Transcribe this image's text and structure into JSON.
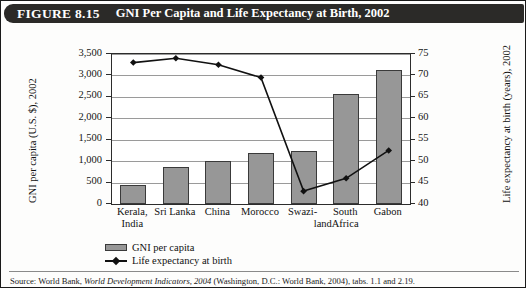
{
  "figure": {
    "label": "FIGURE 8.15",
    "title": "GNI Per Capita and Life Expectancy at Birth, 2002"
  },
  "source": {
    "prefix": "Source: World Bank,",
    "italic": "World Development Indicators, 2004",
    "suffix": "(Washington, D.C.: World Bank, 2004), tabs. 1.1 and 2.19."
  },
  "legend": {
    "items": [
      {
        "label": "GNI per capita",
        "marker": "bar-swatch",
        "color": "#979797"
      },
      {
        "label": "Life expectancy at birth",
        "marker": "line-diamond",
        "color": "#111111"
      }
    ]
  },
  "chart_data": {
    "type": "bar",
    "title": "GNI Per Capita and Life Expectancy at Birth, 2002",
    "xlabel": "",
    "categories": [
      "Kerala, India",
      "Sri Lanka",
      "China",
      "Morocco",
      "Swaziland",
      "South Africa",
      "Gabon"
    ],
    "category_lines": [
      [
        "Kerala,",
        "India"
      ],
      [
        "Sri Lanka",
        ""
      ],
      [
        "China",
        ""
      ],
      [
        "Morocco",
        ""
      ],
      [
        "Swazi-",
        "land"
      ],
      [
        "South",
        "Africa"
      ],
      [
        "Gabon",
        ""
      ]
    ],
    "grid": true,
    "legend_position": "bottom-left",
    "series": [
      {
        "name": "GNI per capita",
        "type": "bar",
        "axis": "left",
        "unit": "U.S. $",
        "values": [
          450,
          870,
          1000,
          1190,
          1240,
          2560,
          3130
        ]
      },
      {
        "name": "Life expectancy at birth",
        "type": "line",
        "axis": "right",
        "unit": "years",
        "values": [
          73,
          74,
          72.5,
          69.5,
          43,
          46,
          52.5
        ]
      }
    ],
    "yaxis_left": {
      "label": "GNI per capita (U.S. $), 2002",
      "ylim": [
        0,
        3500
      ],
      "ticks": [
        0,
        500,
        1000,
        1500,
        2000,
        2500,
        3000,
        3500
      ],
      "tick_labels": [
        "0",
        "500",
        "1,000",
        "1,500",
        "2,000",
        "2,500",
        "3,000",
        "3,500"
      ]
    },
    "yaxis_right": {
      "label": "Life expectancy at birth (years), 2002",
      "ylim": [
        40,
        75
      ],
      "ticks": [
        40,
        45,
        50,
        55,
        60,
        65,
        70,
        75
      ],
      "tick_labels": [
        "40",
        "45",
        "50",
        "55",
        "60",
        "65",
        "70",
        "75"
      ]
    }
  }
}
